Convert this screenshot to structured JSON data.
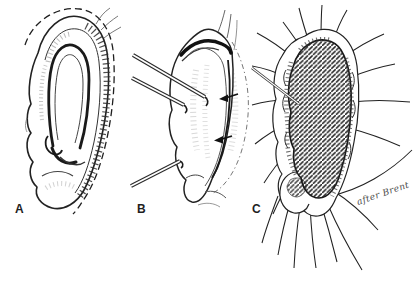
{
  "figure": {
    "panels": [
      {
        "label": "A",
        "illustration": "ear-lateral-view-with-dashed-incision-line-icon"
      },
      {
        "label": "B",
        "illustration": "ear-elevated-with-skin-hooks-and-arrows-icon"
      },
      {
        "label": "C",
        "illustration": "ear-with-hatched-graft-and-radiating-sutures-icon"
      }
    ],
    "attribution": "after Brent"
  },
  "colors": {
    "ink": "#1f1f1f",
    "paper": "#ffffff"
  }
}
